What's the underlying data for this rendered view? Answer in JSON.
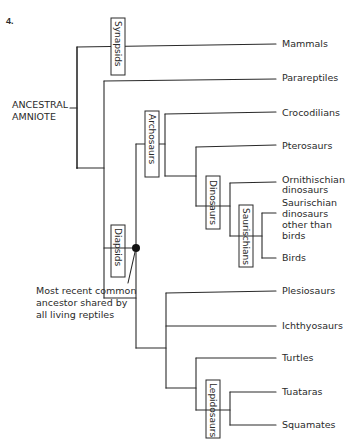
{
  "figure": {
    "number": "4.",
    "root_label_line1": "ANCESTRAL",
    "root_label_line2": "AMNIOTE",
    "annotation": {
      "line1": "Most recent common",
      "line2": "ancestor shared by",
      "line3": "all living reptiles"
    }
  },
  "clades": {
    "synapsids": "Synapsids",
    "diapsids": "Diapsids",
    "archosaurs": "Archosaurs",
    "dinosaurs": "Dinosaurs",
    "saurischians": "Saurischians",
    "lepidosaurs": "Lepidosaurs"
  },
  "taxa": {
    "mammals": "Mammals",
    "parareptiles": "Parareptiles",
    "crocodilians": "Crocodilians",
    "pterosaurs": "Pterosaurs",
    "ornithischian_1": "Ornithischian",
    "ornithischian_2": "dinosaurs",
    "saurischian_1": "Saurischian",
    "saurischian_2": "dinosaurs",
    "saurischian_3": "other than",
    "saurischian_4": "birds",
    "birds": "Birds",
    "plesiosaurs": "Plesiosaurs",
    "ichthyosaurs": "Ichthyosaurs",
    "turtles": "Turtles",
    "tuataras": "Tuataras",
    "squamates": "Squamates"
  }
}
